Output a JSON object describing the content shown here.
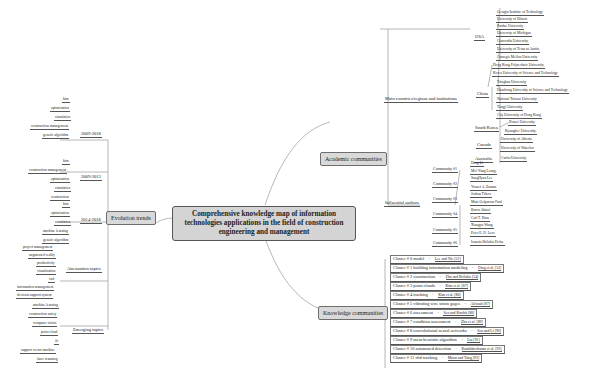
{
  "center": {
    "title": "Comprehensive knowledge map of information technologies applications in the field of construction engineering and management"
  },
  "evolution": {
    "label": "Evolution trends",
    "periods": [
      {
        "label": "2009-2018",
        "topics": [
          "bim",
          "optimization",
          "simulation",
          "construction management",
          "genetic algorithm"
        ]
      },
      {
        "label": "2009-2013",
        "topics": [
          "bim",
          "construction management",
          "optimization",
          "simulation",
          "construction"
        ]
      },
      {
        "label": "2014-2018",
        "topics": [
          "bim",
          "optimization",
          "simulation",
          "machine learning",
          "genetic algorithm"
        ]
      }
    ],
    "attenuation": {
      "label": "Attenuation topics",
      "topics": [
        "project management",
        "augmented reality",
        "productivity",
        "visualization",
        "cad",
        "information management",
        "decision support system"
      ]
    },
    "emerging": {
      "label": "Emerging topics",
      "topics": [
        "machine learning",
        "construction safety",
        "computer vision",
        "point cloud",
        "iit",
        "support vector machine",
        "laser scanning"
      ]
    }
  },
  "academic": {
    "label": "Academic communities",
    "countries": {
      "label": "Main countries/regions and institutions",
      "items": [
        {
          "name": "USA",
          "institutions": [
            "Georgia Institute of Technology",
            "University of Illinois",
            "Purdue University",
            "University of Michigan",
            "Concordia University",
            "University of Texas at Austin",
            "Carnegie Mellon University"
          ]
        },
        {
          "name": "China",
          "institutions": [
            "Hong Kong Polytechnic University",
            "Korea University of Science and Technology",
            "Tsinghua University",
            "Huazhong University of Science and Technology",
            "National Taiwan University",
            "Tongji University",
            "City University of Hong Kong"
          ]
        },
        {
          "name": "South Korea",
          "institutions": [
            "Yonsei University",
            "Kyunghee University"
          ]
        },
        {
          "name": "Canada",
          "institutions": [
            "University of Alberta",
            "University of Waterloo"
          ]
        },
        {
          "name": "Australia",
          "institutions": [
            "Curtin University"
          ]
        }
      ]
    },
    "authors": {
      "label": "Influential authors",
      "communities": [
        {
          "name": "Community #1",
          "authors": [
            "Heng Li",
            "Mei-Yung Leung"
          ]
        },
        {
          "name": "Community #2",
          "authors": [
            "SangHyun Lee",
            "Yousef A. Zaman"
          ]
        },
        {
          "name": "Community #3",
          "authors": [
            "Joshua Tilters",
            "Mani Golparvar-Fard"
          ]
        },
        {
          "name": "Community #4",
          "authors": [
            "Burcu Akinci",
            "Carl T. Haas"
          ]
        },
        {
          "name": "Community #5",
          "authors": [
            "Xiangyu Wang",
            "Peter E. D. Love"
          ]
        },
        {
          "name": "Community #6",
          "authors": [
            "Ioannis Brilakis Defne"
          ]
        }
      ]
    }
  },
  "knowledge": {
    "label": "Knowledge communities",
    "clusters": [
      {
        "label": "Cluster # 0 model",
        "ref": "Lee and Nie [52]"
      },
      {
        "label": "Cluster # 1 building information modeling",
        "ref": "Ding et al. [53]"
      },
      {
        "label": "Cluster # 2 construction",
        "ref": "Zhu and Brilakis [54]"
      },
      {
        "label": "Cluster # 3 point clouds",
        "ref": "Kim et al. [87]"
      },
      {
        "label": "Cluster # 4 tracking",
        "ref": "Kim et al. [86]"
      },
      {
        "label": "Cluster # 5 vibrating wire strain gages",
        "ref": "Alcinah [87]"
      },
      {
        "label": "Cluster # 6 assessment",
        "ref": "Seo and Knobit [88]"
      },
      {
        "label": "Cluster # 7 condition assessment",
        "ref": "Zhu et al. [89]"
      },
      {
        "label": "Cluster # 8 convolutional neural networks",
        "ref": "Seo and Li [90]"
      },
      {
        "label": "Cluster # 9 meta-heuristic algorithm",
        "ref": "Liu [91]"
      },
      {
        "label": "Cluster # 10 automated detection",
        "ref": "Kandabredramo et al. [92]"
      },
      {
        "label": "Cluster # 11 rfid tracking",
        "ref": "Moon and Yang [93]"
      }
    ]
  },
  "ui": {
    "collapse_glyph": "−",
    "cluster_sep": "="
  }
}
